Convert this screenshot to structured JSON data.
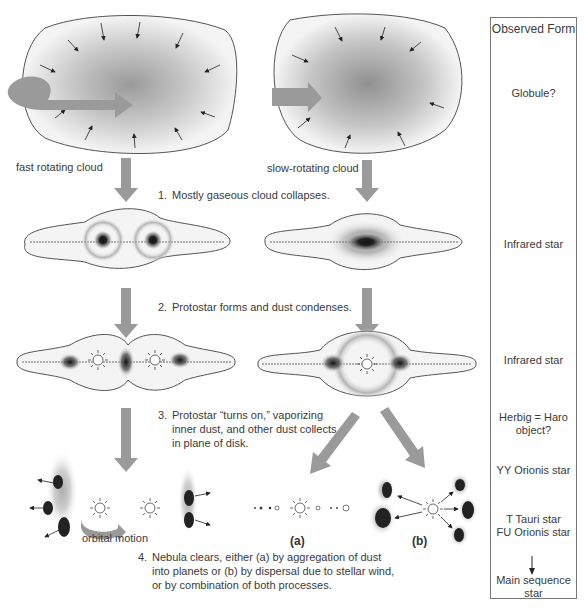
{
  "diagram": {
    "left_path": {
      "label": "fast rotating cloud"
    },
    "right_path": {
      "label": "slow-rotating cloud"
    },
    "steps": [
      {
        "num": "1.",
        "lines": [
          "Mostly gaseous cloud collapses."
        ]
      },
      {
        "num": "2.",
        "lines": [
          "Protostar forms and dust condenses."
        ]
      },
      {
        "num": "3.",
        "lines": [
          "Protostar “turns on,” vaporizing",
          "inner dust, and other dust collects",
          "in plane of disk."
        ]
      },
      {
        "num": "4.",
        "lines": [
          "Nebula clears, either (a) by aggregation of dust",
          "into planets or (b) by dispersal due to stellar wind,",
          "or by combination of both processes."
        ]
      }
    ],
    "orbital_motion_label": "orbital motion",
    "branch_labels": {
      "a": "(a)",
      "b": "(b)"
    },
    "observed_form": {
      "header": "Observed Form",
      "entries": [
        {
          "id": "globule",
          "text": [
            "Globule?"
          ]
        },
        {
          "id": "infrared-1",
          "text": [
            "Infrared star"
          ]
        },
        {
          "id": "infrared-2",
          "text": [
            "Infrared star"
          ]
        },
        {
          "id": "herbig-haro",
          "text": [
            "Herbig = Haro",
            "object?"
          ]
        },
        {
          "id": "yy-orionis",
          "text": [
            "YY Orionis star"
          ]
        },
        {
          "id": "t-tauri",
          "text": [
            "T Tauri star",
            "FU Orionis star"
          ]
        },
        {
          "id": "main-sequence",
          "text": [
            "Main sequence",
            "star"
          ]
        }
      ]
    },
    "colors": {
      "arrow_gray": "#9a9a9a",
      "outline": "#555555",
      "dust": "#222222",
      "box_border": "#777777"
    }
  }
}
